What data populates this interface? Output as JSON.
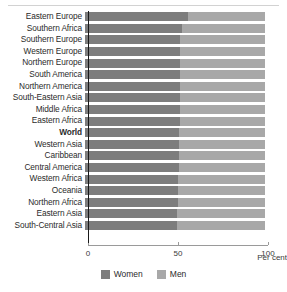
{
  "chart_data": {
    "type": "bar",
    "title": "",
    "subtitle": "",
    "xlabel": "Per cent",
    "ylabel": "",
    "orientation": "horizontal",
    "stacked": true,
    "xlim": [
      0,
      100
    ],
    "xticks": [
      0,
      50,
      100
    ],
    "xtick_labels": [
      "0",
      "50",
      "100"
    ],
    "grid": false,
    "reference_line": 50,
    "legend_position": "bottom-center",
    "highlight_category": "World",
    "categories": [
      "Eastern Europe",
      "Southern Africa",
      "Southern Europe",
      "Western Europe",
      "Northern Europe",
      "South America",
      "Northern America",
      "South-Eastern Asia",
      "Middle Africa",
      "Eastern Africa",
      "World",
      "Western Asia",
      "Caribbean",
      "Central America",
      "Western Africa",
      "Oceania",
      "Northern Africa",
      "Eastern Asia",
      "South-Central Asia"
    ],
    "series": [
      {
        "name": "Women",
        "color": "#7d7d7d",
        "values": [
          57,
          54,
          53,
          53,
          53,
          52.5,
          52.5,
          52.5,
          52.5,
          52.5,
          52,
          52,
          52,
          52,
          51.5,
          51.5,
          51.5,
          51,
          51
        ]
      },
      {
        "name": "Men",
        "color": "#a8a8a8",
        "values": [
          43,
          46,
          47,
          47,
          47,
          47.5,
          47.5,
          47.5,
          47.5,
          47.5,
          48,
          48,
          48,
          48,
          48.5,
          48.5,
          48.5,
          49,
          49
        ]
      }
    ]
  },
  "legend": {
    "items": [
      {
        "label": "Women",
        "color": "#7d7d7d"
      },
      {
        "label": "Men",
        "color": "#a8a8a8"
      }
    ]
  },
  "axis": {
    "unit_label": "Per cent"
  }
}
